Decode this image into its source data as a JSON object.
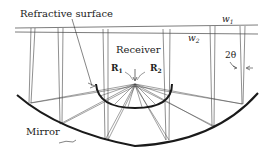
{
  "diagram": {
    "labels": {
      "refractive_surface": "Refractive surface",
      "receiver": "Receiver",
      "mirror": "Mirror",
      "w1": "w",
      "w1_sub": "1",
      "w2": "w",
      "w2_sub": "2",
      "R1": "R",
      "R1_sub": "1",
      "R2": "R",
      "R2_sub": "2",
      "angle": "2θ"
    },
    "colors": {
      "line": "#333333",
      "mirror": "#1a1a1a",
      "text": "#222222"
    }
  }
}
